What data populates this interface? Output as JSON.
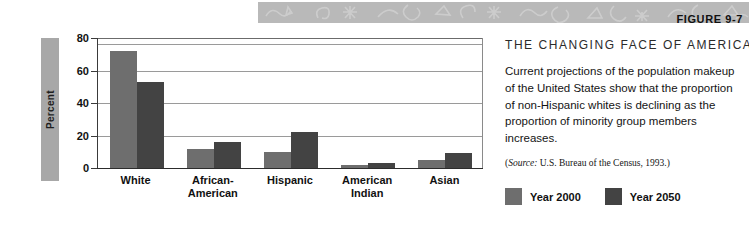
{
  "banner": {
    "figure_label": "FIGURE 9-7",
    "background_color": "#b9b9b9"
  },
  "text_panel": {
    "heading": "THE CHANGING FACE OF AMERICA",
    "body": "Current projections of the population makeup of the United States show that the proportion of non-Hispanic whites is declining as the proportion of minority group members increases.",
    "source_prefix": "(",
    "source_word": "Source:",
    "source_rest": " U.S. Bureau of the Census, 1993.)"
  },
  "legend": {
    "items": [
      {
        "label": "Year 2000",
        "color": "#6e6e6e"
      },
      {
        "label": "Year 2050",
        "color": "#434343"
      }
    ]
  },
  "chart_data": {
    "type": "bar",
    "title": "THE CHANGING FACE OF AMERICA",
    "xlabel": "",
    "ylabel": "Percent",
    "ylim": [
      0,
      80
    ],
    "yticks": [
      0,
      20,
      40,
      60,
      80
    ],
    "grid": true,
    "legend_position": "bottom-right",
    "categories": [
      "White",
      "African-American",
      "Hispanic",
      "American Indian",
      "Asian"
    ],
    "category_lines": [
      [
        "White"
      ],
      [
        "African-",
        "American"
      ],
      [
        "Hispanic"
      ],
      [
        "American",
        "Indian"
      ],
      [
        "Asian"
      ]
    ],
    "series": [
      {
        "name": "Year 2000",
        "color": "#6e6e6e",
        "values": [
          72,
          12,
          10,
          2,
          5
        ]
      },
      {
        "name": "Year 2050",
        "color": "#434343",
        "values": [
          53,
          16,
          22,
          3,
          9
        ]
      }
    ]
  }
}
